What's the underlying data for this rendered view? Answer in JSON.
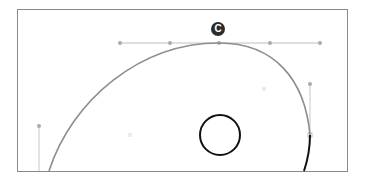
{
  "artboard": {
    "x": 17,
    "y": 9,
    "width": 330,
    "height": 162,
    "border_color": "#8a8a8a"
  },
  "badge": {
    "label": "C",
    "x": 211,
    "y": 22,
    "color": "#2b2b2b"
  },
  "path": {
    "stroke_color": "#8e8e8e",
    "selected_segment_color": "#111111",
    "anchors": [
      {
        "name": "bottom-left",
        "x": 49,
        "y": 171
      },
      {
        "name": "apex",
        "x": 219,
        "y": 43
      },
      {
        "name": "right",
        "x": 310,
        "y": 135
      },
      {
        "name": "bottom-right",
        "x": 304,
        "y": 171
      }
    ]
  },
  "handles": {
    "color": "#b5b5b5",
    "top": {
      "y": 43,
      "points_x": [
        120,
        170,
        219,
        270,
        320
      ]
    },
    "right": {
      "x": 310,
      "y1": 84,
      "y2": 135
    },
    "left": {
      "x": 39,
      "y1": 126,
      "y2": 171
    }
  },
  "center_markers": [
    {
      "x": 264,
      "y": 89
    },
    {
      "x": 130,
      "y": 135
    }
  ],
  "circle": {
    "cx": 220,
    "cy": 135,
    "r": 20,
    "stroke_color": "#111111"
  }
}
